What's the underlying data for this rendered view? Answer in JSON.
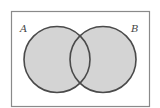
{
  "diagram": {
    "type": "venn",
    "shaded_region": "A union B",
    "sets": [
      {
        "label": "A",
        "cx": 57,
        "cy": 59.5,
        "r": 33
      },
      {
        "label": "B",
        "cx": 103,
        "cy": 59.5,
        "r": 33
      }
    ],
    "universe": {
      "x": 11.5,
      "y": 11.5,
      "width": 138,
      "height": 95
    },
    "colors": {
      "fill": "#d4d4d4",
      "stroke": "#4a4a4a",
      "border": "#8a8a8a",
      "background": "#ffffff"
    }
  },
  "labels": {
    "a": "A",
    "b": "B"
  }
}
